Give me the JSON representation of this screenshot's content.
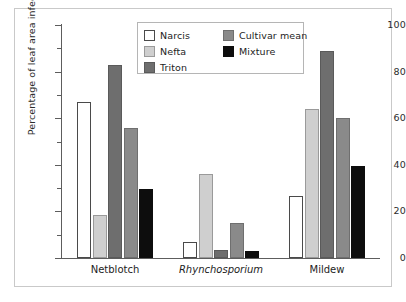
{
  "chart_data": {
    "type": "bar",
    "title": "",
    "subtitle": "",
    "xlabel": "",
    "ylabel": "Percentage of leaf area infected",
    "categories": [
      "Netblotch",
      "Rhynchosporium",
      "Mildew"
    ],
    "category_styles": [
      "normal",
      "italic",
      "normal"
    ],
    "series": [
      {
        "name": "Narcis",
        "color": "#ffffff",
        "edge_color": "#4a4a4a",
        "values": [
          67,
          7,
          26.5
        ]
      },
      {
        "name": "Nefta",
        "color": "#cfcfcf",
        "edge_color": "#9a9a9a",
        "values": [
          18.5,
          36,
          64
        ]
      },
      {
        "name": "Triton",
        "color": "#6e6e6e",
        "edge_color": "#5a5a5a",
        "values": [
          83,
          3.5,
          89
        ]
      },
      {
        "name": "Cultivar mean",
        "color": "#8a8a8a",
        "edge_color": "#6f6f6f",
        "values": [
          56,
          15,
          60
        ]
      },
      {
        "name": "Mixture",
        "color": "#0d0d0d",
        "edge_color": "#0d0d0d",
        "values": [
          29.5,
          3,
          39.5
        ]
      }
    ],
    "ylim": [
      0,
      100
    ],
    "ytick_major": [
      0,
      20,
      40,
      60,
      80,
      100
    ],
    "ytick_minor": [
      10,
      30,
      50,
      70,
      90
    ],
    "ytick_labels": [
      "0",
      "20",
      "40",
      "60",
      "80",
      "100"
    ],
    "grid": false,
    "legend_position": "top-center",
    "legend_columns": 2,
    "bar_edge": true
  },
  "axes": {
    "y_title": "Percentage of leaf area infected",
    "y_labels": [
      "100",
      "80",
      "60",
      "40",
      "20",
      "0"
    ],
    "x_labels": [
      "Netblotch",
      "Rhynchosporium",
      "Mildew"
    ]
  },
  "legend": {
    "column_1": [
      {
        "label": "Narcis"
      },
      {
        "label": "Nefta"
      },
      {
        "label": "Triton"
      }
    ],
    "column_2": [
      {
        "label": "Cultivar mean"
      },
      {
        "label": "Mixture"
      }
    ]
  }
}
